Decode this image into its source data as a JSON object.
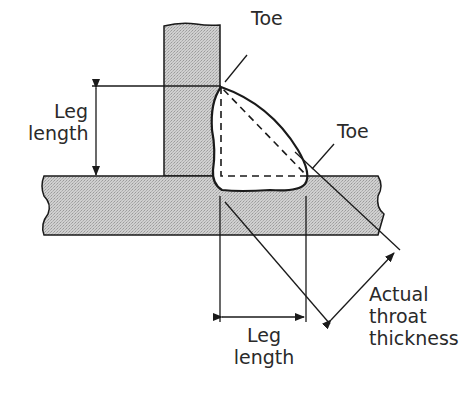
{
  "diagram": {
    "labels": {
      "toe_top": "Toe",
      "toe_right": "Toe",
      "leg_length_vertical": [
        "Leg",
        "length"
      ],
      "leg_length_horizontal": [
        "Leg",
        "length"
      ],
      "throat": [
        "Actual",
        "throat",
        "thickness"
      ]
    },
    "colors": {
      "plate_fill": "#c8c8c8",
      "line": "#1a1a1a",
      "weld_fill": "#ffffff",
      "background": "#ffffff"
    }
  }
}
